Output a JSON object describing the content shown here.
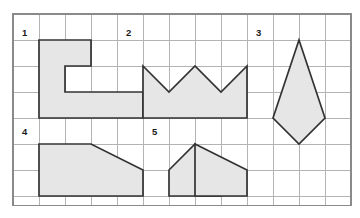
{
  "page": {
    "background_color": "#ffffff"
  },
  "grid": {
    "origin_x": 13,
    "origin_y": 14,
    "cell_size": 26,
    "columns": 13,
    "rows": 7.35,
    "line_color": "#b3b3b3",
    "border_color": "#8a8a8a"
  },
  "style": {
    "shape_fill": "#e6e6e6",
    "shape_stroke": "#333333",
    "label_color": "#1a1a1a"
  },
  "shapes": [
    {
      "label": "1",
      "name": "c-shape-polygon",
      "label_x": 22,
      "label_y": 36,
      "points": "39,40 91,40 91,66 65,66 65,92 143,92 143,118 39,118"
    },
    {
      "label": "2",
      "name": "crown-polygon",
      "label_x": 126,
      "label_y": 36,
      "points": "143,66 169,92 195,66 221,92 247,66 247,118 143,118"
    },
    {
      "label": "3",
      "name": "kite-polygon",
      "label_x": 256,
      "label_y": 36,
      "points": "299,40 325,118 299,144 273,118"
    },
    {
      "label": "4",
      "name": "trapezoid-polygon",
      "label_x": 22,
      "label_y": 135,
      "points": "39,144 91,144 143,170 143,196 39,196"
    },
    {
      "label": "5",
      "name": "zigzag-n-polygon",
      "label_x": 152,
      "label_y": 135,
      "points": "169,170 195,144 221,170 221,196 169,196"
    },
    {
      "label": "",
      "name": "zigzag-n-polygon-right",
      "label_x": 0,
      "label_y": 0,
      "points": "195,144 247,170 247,196 195,196"
    }
  ]
}
